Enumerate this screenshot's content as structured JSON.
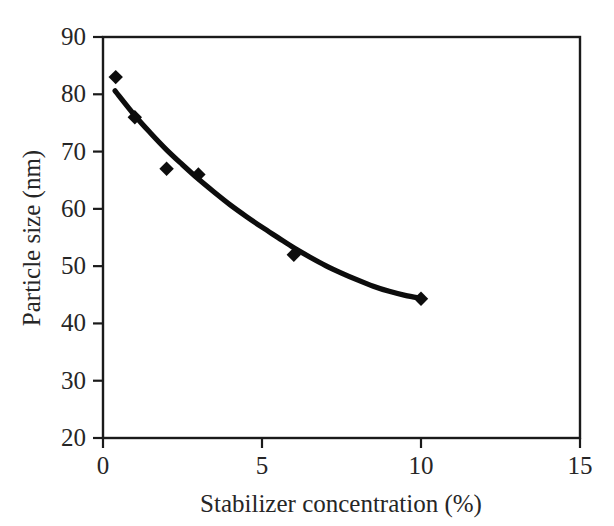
{
  "chart_data": {
    "type": "scatter",
    "title": "",
    "xlabel": "Stabilizer concentration (%)",
    "ylabel": "Particle size (nm)",
    "xlim": [
      0,
      15
    ],
    "ylim": [
      20,
      90
    ],
    "xticks": [
      "0",
      "5",
      "10",
      "15"
    ],
    "xtick_values": [
      0,
      5,
      10,
      15
    ],
    "yticks": [
      "20",
      "30",
      "40",
      "50",
      "60",
      "70",
      "80",
      "90"
    ],
    "ytick_values": [
      20,
      30,
      40,
      50,
      60,
      70,
      80,
      90
    ],
    "grid": false,
    "legend": "none",
    "marker_style": "filled-diamond",
    "x": [
      0.4,
      1.0,
      2.0,
      3.0,
      6.0,
      10.0
    ],
    "y": [
      83.0,
      76.0,
      67.0,
      66.0,
      52.0,
      44.3
    ],
    "series": [
      {
        "name": "Particle size",
        "points": [
          {
            "x": 0.4,
            "y": 83.0
          },
          {
            "x": 1.0,
            "y": 76.0
          },
          {
            "x": 2.0,
            "y": 67.0
          },
          {
            "x": 3.0,
            "y": 66.0
          },
          {
            "x": 6.0,
            "y": 52.0
          },
          {
            "x": 10.0,
            "y": 44.3
          }
        ]
      }
    ],
    "fit_curve": {
      "name": "exponential decay trend",
      "points": [
        {
          "x": 0.38,
          "y": 80.6
        },
        {
          "x": 1.0,
          "y": 76.3
        },
        {
          "x": 1.5,
          "y": 73.2
        },
        {
          "x": 2.0,
          "y": 70.3
        },
        {
          "x": 2.5,
          "y": 67.7
        },
        {
          "x": 3.0,
          "y": 65.2
        },
        {
          "x": 3.5,
          "y": 62.9
        },
        {
          "x": 4.0,
          "y": 60.7
        },
        {
          "x": 4.5,
          "y": 58.7
        },
        {
          "x": 5.0,
          "y": 56.8
        },
        {
          "x": 5.5,
          "y": 55.0
        },
        {
          "x": 6.0,
          "y": 53.2
        },
        {
          "x": 6.5,
          "y": 51.6
        },
        {
          "x": 7.0,
          "y": 50.1
        },
        {
          "x": 7.5,
          "y": 48.8
        },
        {
          "x": 8.0,
          "y": 47.6
        },
        {
          "x": 8.5,
          "y": 46.5
        },
        {
          "x": 9.0,
          "y": 45.6
        },
        {
          "x": 9.5,
          "y": 44.9
        },
        {
          "x": 10.0,
          "y": 44.4
        }
      ]
    },
    "colors": {
      "marker": "#0d0d0d",
      "curve": "#0d0d0d",
      "axis": "#1a1a1a",
      "text": "#262626",
      "background": "#ffffff"
    }
  }
}
